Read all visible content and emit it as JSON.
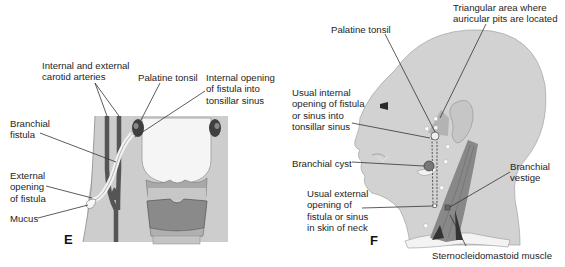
{
  "panels": [
    {
      "id": "E",
      "letter": "E",
      "labels": {
        "carotid": [
          "Internal and external",
          "carotid arteries"
        ],
        "palatine_tonsil": "Palatine tonsil",
        "internal_opening": [
          "Internal opening",
          "of fistula into",
          "tonsillar sinus"
        ],
        "branchial_fistula": [
          "Branchial",
          "fistula"
        ],
        "external_opening": [
          "External",
          "opening",
          "of fistula"
        ],
        "mucus": "Mucus"
      }
    },
    {
      "id": "F",
      "letter": "F",
      "labels": {
        "triangular_area": [
          "Triangular area where",
          "auricular pits are located"
        ],
        "palatine_tonsil": "Palatine tonsil",
        "usual_internal": [
          "Usual internal",
          "opening of fistula",
          "or sinus into",
          "tonsillar sinus"
        ],
        "branchial_cyst": "Branchial cyst",
        "usual_external": [
          "Usual external",
          "opening of",
          "fistula or sinus",
          "in skin of neck"
        ],
        "branchial_vestige": [
          "Branchial",
          "vestige"
        ],
        "scm": "Sternocleidomastoid muscle"
      }
    }
  ],
  "colors": {
    "tissue_gray": "#c9c9c9",
    "artery_dark": "#5a5a5a",
    "pharynx_white": "#f4f4f4",
    "cartilage": "#8c8c8c",
    "tonsil_dark": "#4a4a4a",
    "skin": "#d2d2d2",
    "muscle": "#8a8a8a",
    "leader": "#333333"
  }
}
